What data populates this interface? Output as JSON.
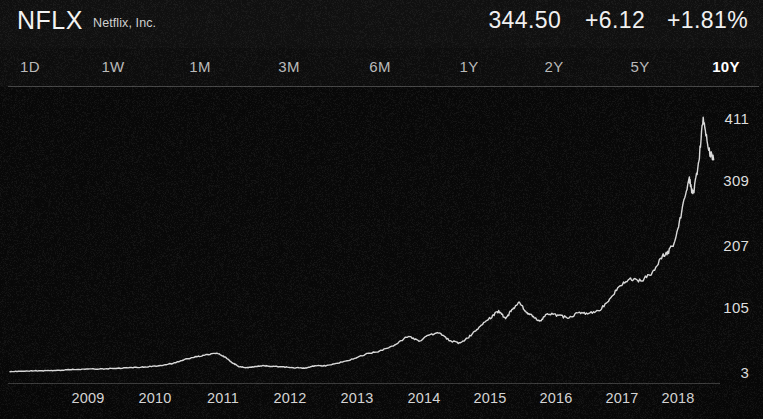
{
  "header": {
    "ticker": "NFLX",
    "company": "Netflix, Inc.",
    "price": "344.50",
    "change": "+6.12",
    "change_percent": "+1.81%"
  },
  "timeframes": [
    {
      "label": "1D",
      "selected": false,
      "x": 30
    },
    {
      "label": "1W",
      "selected": false,
      "x": 113
    },
    {
      "label": "1M",
      "selected": false,
      "x": 200
    },
    {
      "label": "3M",
      "selected": false,
      "x": 289
    },
    {
      "label": "6M",
      "selected": false,
      "x": 380
    },
    {
      "label": "1Y",
      "selected": false,
      "x": 469
    },
    {
      "label": "2Y",
      "selected": false,
      "x": 554
    },
    {
      "label": "5Y",
      "selected": false,
      "x": 640
    },
    {
      "label": "10Y",
      "selected": true,
      "x": 726
    }
  ],
  "chart_data": {
    "type": "line",
    "xlabel": "",
    "ylabel": "",
    "grid": false,
    "legend": null,
    "line_color": "#d8d8d8",
    "ylim": [
      3,
      411
    ],
    "yticks": [
      411,
      309,
      207,
      105,
      3
    ],
    "xticks": [
      "2009",
      "2010",
      "2011",
      "2012",
      "2013",
      "2014",
      "2015",
      "2016",
      "2017",
      "2018"
    ],
    "xtick_positions": [
      88,
      155,
      223,
      290,
      357,
      424,
      490,
      556,
      622,
      678
    ],
    "ytick_positions": [
      118,
      180,
      245,
      307,
      372
    ],
    "x": [
      2008.45,
      2008.6,
      2008.8,
      2009.0,
      2009.2,
      2009.4,
      2009.6,
      2009.8,
      2010.0,
      2010.2,
      2010.4,
      2010.6,
      2010.8,
      2011.0,
      2011.15,
      2011.3,
      2011.45,
      2011.55,
      2011.65,
      2011.75,
      2011.85,
      2011.95,
      2012.1,
      2012.25,
      2012.4,
      2012.55,
      2012.7,
      2012.85,
      2013.0,
      2013.2,
      2013.4,
      2013.6,
      2013.8,
      2014.0,
      2014.2,
      2014.35,
      2014.5,
      2014.65,
      2014.8,
      2014.95,
      2015.1,
      2015.25,
      2015.4,
      2015.5,
      2015.6,
      2015.7,
      2015.8,
      2015.9,
      2016.0,
      2016.1,
      2016.2,
      2016.35,
      2016.5,
      2016.65,
      2016.8,
      2016.95,
      2017.1,
      2017.25,
      2017.4,
      2017.55,
      2017.7,
      2017.85,
      2017.95,
      2018.05,
      2018.15,
      2018.25,
      2018.3,
      2018.38,
      2018.45,
      2018.52,
      2018.6
    ],
    "y": [
      4,
      4,
      5,
      5,
      6,
      7,
      8,
      8,
      9,
      10,
      11,
      13,
      17,
      24,
      28,
      31,
      33,
      27,
      18,
      12,
      10,
      11,
      13,
      12,
      11,
      10,
      9,
      13,
      13,
      18,
      24,
      32,
      37,
      47,
      61,
      52,
      63,
      66,
      53,
      49,
      62,
      78,
      92,
      101,
      88,
      105,
      114,
      98,
      92,
      84,
      97,
      94,
      90,
      98,
      97,
      101,
      120,
      143,
      152,
      149,
      161,
      188,
      196,
      214,
      267,
      315,
      286,
      334,
      411,
      362,
      344
    ]
  }
}
